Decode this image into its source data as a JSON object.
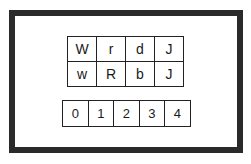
{
  "letter_grid": [
    [
      "W",
      "r",
      "d",
      "J"
    ],
    [
      "w",
      "R",
      "b",
      "J"
    ]
  ],
  "digit_row": [
    "0",
    "1",
    "2",
    "3",
    "4"
  ]
}
